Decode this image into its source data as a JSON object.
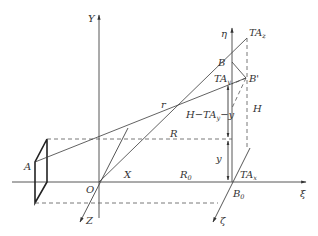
{
  "diagram": {
    "type": "geometric-coordinate-diagram",
    "axes": {
      "Y": "Y",
      "X": "X",
      "Z": "Z",
      "eta": "η",
      "xi": "ξ",
      "zeta": "ζ"
    },
    "points": {
      "A": "A",
      "O": "O",
      "B": "B",
      "B_prime": "B'",
      "B0": "B",
      "B0_sub": "0"
    },
    "labels": {
      "TA_z": "TA",
      "TA_z_sub": "z",
      "TA_y": "TA",
      "TA_y_sub": "y",
      "TA_x": "TA",
      "TA_x_sub": "x",
      "r": "r",
      "R": "R",
      "R0": "R",
      "R0_sub": "0",
      "H": "H",
      "y": "y",
      "H_minus": "H−TA",
      "H_minus_sub": "y",
      "H_minus_tail": "−y"
    },
    "colors": {
      "line": "#3a3a3a",
      "text": "#333333",
      "background": "#ffffff"
    }
  }
}
